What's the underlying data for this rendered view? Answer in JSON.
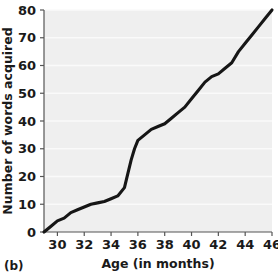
{
  "figure": {
    "panel_label": "(b)",
    "background_color": "#ffffff",
    "plot_background_color": "#efefef",
    "gridline_color": "#fafafa",
    "line_color": "#161616",
    "axis_color": "#555555",
    "text_color": "#1a1a1a"
  },
  "chart_data": {
    "type": "line",
    "title": "",
    "xlabel": "Age (in months)",
    "ylabel": "Number of words acquired",
    "xlim": [
      29,
      46
    ],
    "ylim": [
      0,
      80
    ],
    "xticks": [
      30,
      32,
      34,
      36,
      38,
      40,
      42,
      44,
      46
    ],
    "yticks": [
      0,
      10,
      20,
      30,
      40,
      50,
      60,
      70,
      80
    ],
    "xtick_labels": [
      "30",
      "32",
      "34",
      "36",
      "38",
      "40",
      "42",
      "44",
      "46"
    ],
    "ytick_labels": [
      "0",
      "10",
      "20",
      "30",
      "40",
      "50",
      "60",
      "70",
      "80"
    ],
    "grid": true,
    "grid_axis": "y",
    "legend": false,
    "legend_position": "none",
    "x": [
      29.0,
      29.5,
      30.0,
      30.5,
      31.0,
      31.5,
      32.0,
      32.5,
      33.0,
      33.5,
      34.0,
      34.5,
      35.0,
      35.25,
      35.5,
      35.75,
      36.0,
      36.5,
      37.0,
      37.5,
      38.0,
      38.5,
      39.0,
      39.5,
      40.0,
      40.5,
      41.0,
      41.5,
      42.0,
      42.5,
      43.0,
      43.5,
      44.0,
      44.5,
      45.0,
      45.5,
      46.0
    ],
    "y": [
      0,
      2,
      4,
      5,
      7,
      8,
      9,
      10,
      10.5,
      11,
      12,
      13,
      16,
      21,
      26,
      30,
      33,
      35,
      37,
      38,
      39,
      41,
      43,
      45,
      48,
      51,
      54,
      56,
      57,
      59,
      61,
      65,
      68,
      71,
      74,
      77,
      80
    ],
    "series": [
      {
        "name": "Words acquired",
        "x": [
          29.0,
          29.5,
          30.0,
          30.5,
          31.0,
          31.5,
          32.0,
          32.5,
          33.0,
          33.5,
          34.0,
          34.5,
          35.0,
          35.25,
          35.5,
          35.75,
          36.0,
          36.5,
          37.0,
          37.5,
          38.0,
          38.5,
          39.0,
          39.5,
          40.0,
          40.5,
          41.0,
          41.5,
          42.0,
          42.5,
          43.0,
          43.5,
          44.0,
          44.5,
          45.0,
          45.5,
          46.0
        ],
        "values": [
          0,
          2,
          4,
          5,
          7,
          8,
          9,
          10,
          10.5,
          11,
          12,
          13,
          16,
          21,
          26,
          30,
          33,
          35,
          37,
          38,
          39,
          41,
          43,
          45,
          48,
          51,
          54,
          56,
          57,
          59,
          61,
          65,
          68,
          71,
          74,
          77,
          80
        ]
      }
    ]
  }
}
